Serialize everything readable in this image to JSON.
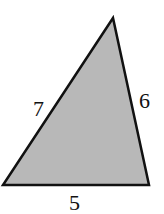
{
  "diagram": {
    "type": "triangle",
    "fill_color": "#b8b8b8",
    "stroke_color": "#111111",
    "vertices": {
      "top": [
        113,
        18
      ],
      "bottom_left": [
        3,
        185
      ],
      "bottom_right": [
        149,
        185
      ]
    },
    "side_labels": {
      "left": "7",
      "right": "6",
      "bottom": "5"
    }
  }
}
